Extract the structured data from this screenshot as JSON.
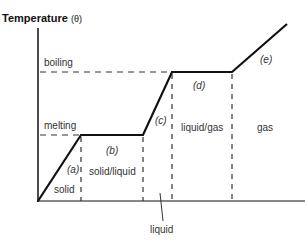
{
  "diagram": {
    "title": "Temperature",
    "title_symbol": "(θ)",
    "levels": {
      "boiling": "boiling",
      "melting": "melting"
    },
    "segments": [
      {
        "id": "a",
        "label": "(a)",
        "phase": "solid"
      },
      {
        "id": "b",
        "label": "(b)",
        "phase": "solid/liquid"
      },
      {
        "id": "c",
        "label": "(c)",
        "phase": "liquid"
      },
      {
        "id": "d",
        "label": "(d)",
        "phase": "liquid/gas"
      },
      {
        "id": "e",
        "label": "(e)",
        "phase": "gas"
      }
    ],
    "colors": {
      "line": "#111111",
      "text": "#333333",
      "background": "#ffffff"
    }
  }
}
